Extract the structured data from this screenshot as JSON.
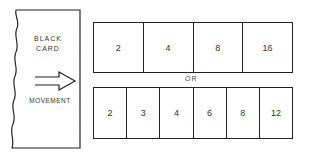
{
  "card": {
    "title_line1": "BLACK",
    "title_line2": "CARD",
    "movement_label": "MOVEMENT",
    "arrow_icon": "right-arrow"
  },
  "top_row": {
    "cells": [
      "2",
      "4",
      "8",
      "16"
    ]
  },
  "separator": "OR",
  "bottom_row": {
    "cells": [
      "2",
      "3",
      "4",
      "6",
      "8",
      "12"
    ]
  }
}
